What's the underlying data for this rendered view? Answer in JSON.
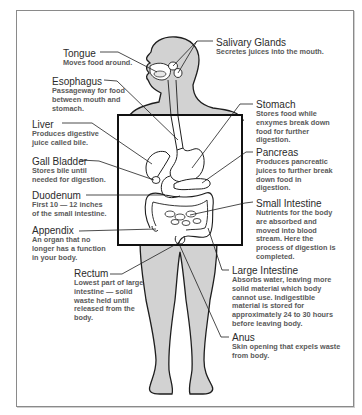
{
  "diagram": {
    "colors": {
      "body_fill": "#d2d2d2",
      "outline": "#1e1e1e",
      "frame": "#8a8a8a",
      "title_text": "#2b2b2b",
      "desc_text": "#5a5a5a"
    }
  },
  "labels": {
    "tongue": {
      "title": "Tongue",
      "lines": [
        "Moves food around."
      ]
    },
    "esophagus": {
      "title": "Esophagus",
      "lines": [
        "Passageway for food",
        "between mouth and",
        "stomach."
      ]
    },
    "liver": {
      "title": "Liver",
      "lines": [
        "Produces digestive",
        "juice called bile."
      ]
    },
    "gall_bladder": {
      "title": "Gall Bladder",
      "lines": [
        "Stores bile until",
        "needed for digestion."
      ]
    },
    "duodenum": {
      "title": "Duodenum",
      "lines": [
        "First 10 — 12 inches",
        "of the small intestine."
      ]
    },
    "appendix": {
      "title": "Appendix",
      "lines": [
        "An organ that no",
        "longer has a function",
        "in your body."
      ]
    },
    "rectum": {
      "title": "Rectum",
      "lines": [
        "Lowest part of large",
        "intestine — solid",
        "waste held until",
        "released from the",
        "body."
      ]
    },
    "salivary_glands": {
      "title": "Salivary Glands",
      "lines": [
        "Secretes juices into the mouth."
      ]
    },
    "stomach": {
      "title": "Stomach",
      "lines": [
        "Stores food while",
        "enxymes break down",
        "food for further",
        "digestion."
      ]
    },
    "pancreas": {
      "title": "Pancreas",
      "lines": [
        "Produces pancreatic",
        "juices to further break",
        "down food in",
        "digestion."
      ]
    },
    "small_intestine": {
      "title": "Small Intestine",
      "lines": [
        "Nutrients for the body",
        "are absorbed and",
        "moved into blood",
        "stream. Here the",
        "process of digestion is",
        "completed."
      ]
    },
    "large_intestine": {
      "title": "Large Intestine",
      "lines": [
        "Absorbs water, leaving more",
        "solid material which body",
        "cannot use. Indigestible",
        "material is stored for",
        "approximately 24 to 30 hours",
        "before leaving body."
      ]
    },
    "anus": {
      "title": "Anus",
      "lines": [
        "Skin opening that expels waste",
        "from body."
      ]
    }
  }
}
